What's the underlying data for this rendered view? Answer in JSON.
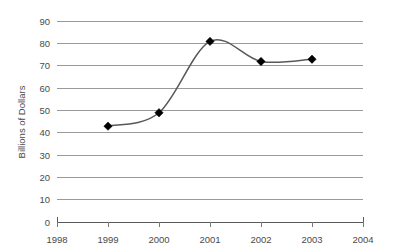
{
  "chart_data": {
    "type": "line",
    "title": "",
    "xlabel": "",
    "ylabel": "Billions of Dollars",
    "x": [
      1999,
      2000,
      2001,
      2002,
      2003
    ],
    "values": [
      43,
      49,
      81,
      72,
      73
    ],
    "series": [
      {
        "name": "Billions of Dollars",
        "values": [
          43,
          49,
          81,
          72,
          73
        ]
      }
    ],
    "x_tick_labels": [
      "1998",
      "1999",
      "2000",
      "2001",
      "2002",
      "2003",
      "2004"
    ],
    "y_tick_labels": [
      "0",
      "10",
      "20",
      "30",
      "40",
      "50",
      "60",
      "70",
      "80",
      "90"
    ],
    "xlim": [
      1998,
      2004
    ],
    "ylim": [
      0,
      90
    ],
    "grid": "horizontal",
    "legend": "none",
    "marker": "diamond",
    "line_smooth": true,
    "colors": {
      "line": "#585858",
      "marker": "#000000",
      "gridline": "#9a9a9a",
      "axis": "#5a5a5a",
      "text": "#4a4a4a",
      "background": "#ffffff"
    }
  }
}
